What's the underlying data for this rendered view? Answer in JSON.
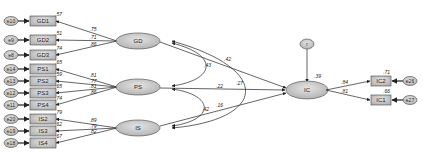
{
  "diagram": {
    "type": "structural-equation-model",
    "latent": {
      "GD": {
        "label": "GD",
        "x": 138,
        "y": 41
      },
      "PS": {
        "label": "PS",
        "x": 138,
        "y": 87
      },
      "IS": {
        "label": "IS",
        "x": 138,
        "y": 128
      },
      "IC": {
        "label": "IC",
        "x": 307,
        "y": 90,
        "r2": ".39"
      }
    },
    "disturbance": {
      "label": "r",
      "x": 307,
      "y": 44
    },
    "indicators": [
      {
        "id": "GD1",
        "label": "GD1",
        "error": "e10",
        "y": 21,
        "loading": ".75",
        "r2": ".57",
        "factor": "GD"
      },
      {
        "id": "GD2",
        "label": "GD2",
        "error": "e9",
        "y": 40,
        "loading": ".71",
        "r2": ".51",
        "factor": "GD"
      },
      {
        "id": "GD3",
        "label": "GD3",
        "error": "e8",
        "y": 55,
        "loading": ".86",
        "r2": ".74",
        "factor": "GD"
      },
      {
        "id": "PS1",
        "label": "PS1",
        "error": "e14",
        "y": 69,
        "loading": ".81",
        "r2": ".65",
        "factor": "PS"
      },
      {
        "id": "PS2",
        "label": "PS2",
        "error": "e13",
        "y": 81,
        "loading": ".77",
        "r2": ".59",
        "factor": "PS"
      },
      {
        "id": "PS3",
        "label": "PS3",
        "error": "e12",
        "y": 93,
        "loading": ".81",
        "r2": ".65",
        "factor": "PS"
      },
      {
        "id": "PS4",
        "label": "PS4",
        "error": "e11",
        "y": 105,
        "loading": ".86",
        "r2": ".74",
        "factor": "PS"
      },
      {
        "id": "IS2",
        "label": "IS2",
        "error": "e20",
        "y": 119,
        "loading": ".89",
        "r2": ".79",
        "factor": "IS"
      },
      {
        "id": "IS3",
        "label": "IS3",
        "error": "e19",
        "y": 131,
        "loading": ".79",
        "r2": ".62",
        "factor": "IS"
      },
      {
        "id": "IS4",
        "label": "IS4",
        "error": "e18",
        "y": 143,
        "loading": ".82",
        "r2": ".67",
        "factor": "IS"
      }
    ],
    "outcome_indicators": [
      {
        "id": "IC2",
        "label": "IC2",
        "error": "e26",
        "y": 81,
        "loading": ".84",
        "r2": ".71"
      },
      {
        "id": "IC1",
        "label": "IC1",
        "error": "e27",
        "y": 100,
        "loading": ".81",
        "r2": ".66"
      }
    ],
    "correlations": [
      {
        "from": "GD",
        "to": "PS",
        "value": ".43"
      },
      {
        "from": "PS",
        "to": "IS",
        "value": ".42"
      },
      {
        "from": "GD",
        "to": "IS",
        "value": ".27"
      }
    ],
    "paths": [
      {
        "from": "GD",
        "to": "IC",
        "value": ".42"
      },
      {
        "from": "PS",
        "to": "IC",
        "value": ".22"
      },
      {
        "from": "IS",
        "to": "IC",
        "value": ".16"
      }
    ],
    "colors": {
      "node_fill": "#c8c8c8",
      "node_stroke": "#444444",
      "line": "#222222",
      "background": "#ffffff"
    }
  }
}
